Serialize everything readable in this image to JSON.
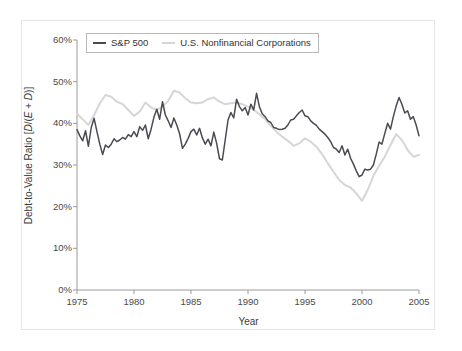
{
  "figure": {
    "background_color": "#ffffff",
    "frame_color": "#e6e6e6"
  },
  "axis": {
    "x_title": "Year",
    "y_title_prefix": "Debt-to-Value Ratio [",
    "y_title_d1": "D",
    "y_title_mid": "/(",
    "y_title_e": "E",
    "y_title_plus": " + ",
    "y_title_d2": "D",
    "y_title_suffix": ")]"
  },
  "legend": {
    "entries": [
      {
        "label": "S&P 500",
        "color": "#4a4a52"
      },
      {
        "label": "U.S. Nonfinancial Corporations",
        "color": "#d6d6d6"
      }
    ]
  },
  "chart_data": {
    "type": "line",
    "title": "",
    "subtitle": "",
    "xlabel": "Year",
    "ylabel": "Debt-to-Value Ratio [D/(E + D)]",
    "xlim": [
      1975,
      2005
    ],
    "ylim": [
      0,
      60
    ],
    "xticks": [
      1975,
      1980,
      1985,
      1990,
      1995,
      2000,
      2005
    ],
    "xtick_labels": [
      "1975",
      "1980",
      "1985",
      "1990",
      "1995",
      "2000",
      "2005"
    ],
    "yticks": [
      0,
      10,
      20,
      30,
      40,
      50,
      60
    ],
    "ytick_labels": [
      "0%",
      "10%",
      "20%",
      "30%",
      "40%",
      "50%",
      "60%"
    ],
    "y_unit": "percent",
    "grid": false,
    "legend_position": "top-left-inside",
    "series": [
      {
        "name": "S&P 500",
        "color": "#4a4a52",
        "line_width": 1.5,
        "x": [
          1975.0,
          1975.25,
          1975.5,
          1975.75,
          1976.0,
          1976.25,
          1976.5,
          1976.75,
          1977.0,
          1977.25,
          1977.5,
          1977.75,
          1978.0,
          1978.25,
          1978.5,
          1978.75,
          1979.0,
          1979.25,
          1979.5,
          1979.75,
          1980.0,
          1980.25,
          1980.5,
          1980.75,
          1981.0,
          1981.25,
          1981.5,
          1981.75,
          1982.0,
          1982.25,
          1982.5,
          1982.75,
          1983.0,
          1983.25,
          1983.5,
          1983.75,
          1984.0,
          1984.25,
          1984.5,
          1984.75,
          1985.0,
          1985.25,
          1985.5,
          1985.75,
          1986.0,
          1986.25,
          1986.5,
          1986.75,
          1987.0,
          1987.25,
          1987.5,
          1987.75,
          1988.0,
          1988.25,
          1988.5,
          1988.75,
          1989.0,
          1989.25,
          1989.5,
          1989.75,
          1990.0,
          1990.25,
          1990.5,
          1990.75,
          1991.0,
          1991.25,
          1991.5,
          1991.75,
          1992.0,
          1992.25,
          1992.5,
          1992.75,
          1993.0,
          1993.25,
          1993.5,
          1993.75,
          1994.0,
          1994.25,
          1994.5,
          1994.75,
          1995.0,
          1995.25,
          1995.5,
          1995.75,
          1996.0,
          1996.25,
          1996.5,
          1996.75,
          1997.0,
          1997.25,
          1997.5,
          1997.75,
          1998.0,
          1998.25,
          1998.5,
          1998.75,
          1999.0,
          1999.25,
          1999.5,
          1999.75,
          2000.0,
          2000.25,
          2000.5,
          2000.75,
          2001.0,
          2001.25,
          2001.5,
          2001.75,
          2002.0,
          2002.25,
          2002.5,
          2002.75,
          2003.0,
          2003.25,
          2003.5,
          2003.75,
          2004.0,
          2004.25,
          2004.5,
          2004.75,
          2005.0
        ],
        "values": [
          38.5,
          37.0,
          35.8,
          38.2,
          34.5,
          39.0,
          41.2,
          38.0,
          35.0,
          32.5,
          34.8,
          34.2,
          35.0,
          36.3,
          35.6,
          36.0,
          36.6,
          36.2,
          37.3,
          36.8,
          38.0,
          36.8,
          39.2,
          38.3,
          39.6,
          36.3,
          38.6,
          41.5,
          43.4,
          41.0,
          45.2,
          42.0,
          40.6,
          39.0,
          41.3,
          39.6,
          37.5,
          34.0,
          35.0,
          36.4,
          38.0,
          38.6,
          37.2,
          38.8,
          36.5,
          35.0,
          36.2,
          34.6,
          37.9,
          35.2,
          31.5,
          31.2,
          36.0,
          40.8,
          42.6,
          41.3,
          45.8,
          44.0,
          43.0,
          43.8,
          42.0,
          44.6,
          43.2,
          47.2,
          44.0,
          42.3,
          41.6,
          40.6,
          40.2,
          39.0,
          38.8,
          38.5,
          38.6,
          38.8,
          39.6,
          40.8,
          41.0,
          41.8,
          42.6,
          43.2,
          41.8,
          41.6,
          40.6,
          40.0,
          39.5,
          38.6,
          38.0,
          37.4,
          36.6,
          35.6,
          34.2,
          33.8,
          33.0,
          34.6,
          32.4,
          33.8,
          31.6,
          30.2,
          28.6,
          27.2,
          27.6,
          29.0,
          28.8,
          29.0,
          30.0,
          32.6,
          35.5,
          35.0,
          37.6,
          40.0,
          38.6,
          41.6,
          44.2,
          46.2,
          44.6,
          42.5,
          43.0,
          41.0,
          41.6,
          39.6,
          37.0
        ]
      },
      {
        "name": "U.S. Nonfinancial Corporations",
        "color": "#d6d6d6",
        "line_width": 2.0,
        "x": [
          1975.0,
          1975.5,
          1976.0,
          1976.5,
          1977.0,
          1977.5,
          1978.0,
          1978.5,
          1979.0,
          1979.5,
          1980.0,
          1980.5,
          1981.0,
          1981.5,
          1982.0,
          1982.5,
          1983.0,
          1983.5,
          1984.0,
          1984.5,
          1985.0,
          1985.5,
          1986.0,
          1986.5,
          1987.0,
          1987.5,
          1988.0,
          1988.5,
          1989.0,
          1989.5,
          1990.0,
          1990.5,
          1991.0,
          1991.5,
          1992.0,
          1992.5,
          1993.0,
          1993.5,
          1994.0,
          1994.5,
          1995.0,
          1995.5,
          1996.0,
          1996.5,
          1997.0,
          1997.5,
          1998.0,
          1998.5,
          1999.0,
          1999.5,
          2000.0,
          2000.5,
          2001.0,
          2001.5,
          2002.0,
          2002.5,
          2003.0,
          2003.5,
          2004.0,
          2004.5,
          2005.0
        ],
        "values": [
          42.3,
          41.0,
          39.6,
          42.0,
          44.8,
          46.8,
          46.4,
          45.2,
          44.6,
          43.2,
          41.8,
          42.8,
          45.0,
          43.8,
          43.2,
          44.0,
          45.4,
          47.8,
          47.4,
          46.0,
          45.0,
          44.8,
          45.0,
          45.8,
          46.2,
          45.2,
          44.6,
          44.8,
          45.0,
          44.6,
          44.0,
          43.2,
          42.2,
          41.0,
          39.4,
          38.0,
          36.8,
          35.8,
          34.6,
          35.2,
          36.4,
          35.6,
          34.4,
          32.6,
          30.4,
          28.4,
          26.4,
          25.2,
          24.6,
          23.2,
          21.4,
          24.0,
          27.4,
          29.8,
          32.0,
          34.8,
          37.4,
          36.0,
          33.6,
          32.0,
          32.4
        ]
      }
    ]
  }
}
